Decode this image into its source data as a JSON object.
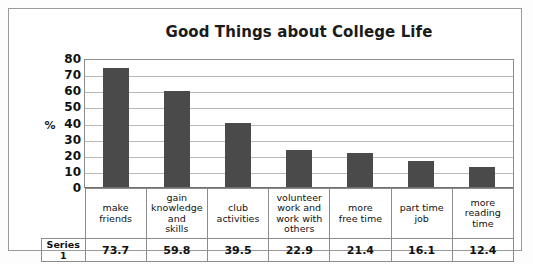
{
  "chart_data": {
    "type": "bar",
    "title": "Good Things about College Life",
    "xlabel": "",
    "ylabel": "%",
    "ylim": [
      0,
      80
    ],
    "ytick_step": 10,
    "yticks": [
      "80",
      "70",
      "60",
      "50",
      "40",
      "30",
      "20",
      "10",
      "0"
    ],
    "grid": true,
    "legend": "none",
    "series_name": "Series 1",
    "categories": [
      "make friends",
      "gain knowledge and skills",
      "club activities",
      "volunteer work and work with others",
      "more free time",
      "part time job",
      "more reading time"
    ],
    "category_lines": [
      [
        "make",
        "friends"
      ],
      [
        "gain",
        "knowledge",
        "and",
        "skills"
      ],
      [
        "club",
        "activities"
      ],
      [
        "volunteer",
        "work and",
        "work with",
        "others"
      ],
      [
        "more",
        "free time"
      ],
      [
        "part time",
        "job"
      ],
      [
        "more",
        "reading",
        "time"
      ]
    ],
    "values": [
      73.7,
      59.8,
      39.5,
      22.9,
      21.4,
      16.1,
      12.4
    ],
    "value_labels": [
      "73.7",
      "59.8",
      "39.5",
      "22.9",
      "21.4",
      "16.1",
      "12.4"
    ],
    "bar_color": "#4a4a4a",
    "plot_background": "#ffffff",
    "gridline_color": "#b9b9b9"
  }
}
